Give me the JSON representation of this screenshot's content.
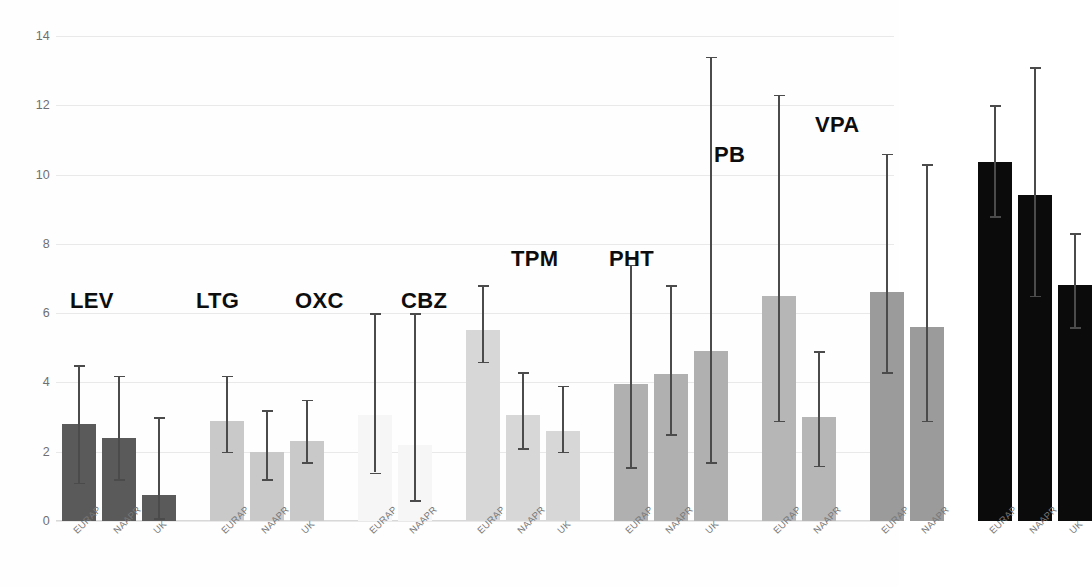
{
  "chart_data": {
    "type": "bar",
    "title": "",
    "xlabel": "",
    "ylabel": "",
    "ylim": [
      0,
      14
    ],
    "yticks": [
      0,
      2,
      4,
      6,
      8,
      10,
      12,
      14
    ],
    "ytick_labels": [
      "0",
      "2",
      "4",
      "6",
      "8",
      "10",
      "12",
      "14"
    ],
    "grid": true,
    "legend": "none",
    "error_bars": "95% confidence interval",
    "categories": [
      "EURAP",
      "NAAPR",
      "UK"
    ],
    "groups": [
      {
        "label": "LEV",
        "color": "#5a5a5a",
        "label_x": 70,
        "label_y": 288,
        "bars": [
          {
            "category": "EURAP",
            "value": 2.8,
            "ci_low": 1.1,
            "ci_high": 4.5
          },
          {
            "category": "NAAPR",
            "value": 2.4,
            "ci_low": 1.2,
            "ci_high": 4.2
          },
          {
            "category": "UK",
            "value": 0.75,
            "ci_low": 0.08,
            "ci_high": 3.0
          }
        ]
      },
      {
        "label": "LTG",
        "color": "#c9c9c9",
        "label_x": 196,
        "label_y": 288,
        "bars": [
          {
            "category": "EURAP",
            "value": 2.9,
            "ci_low": 2.0,
            "ci_high": 4.2
          },
          {
            "category": "NAAPR",
            "value": 2.0,
            "ci_low": 1.2,
            "ci_high": 3.2
          },
          {
            "category": "UK",
            "value": 2.3,
            "ci_low": 1.7,
            "ci_high": 3.5
          }
        ]
      },
      {
        "label": "OXC",
        "color": "#f6f6f6",
        "label_x": 295,
        "label_y": 288,
        "bars": [
          {
            "category": "EURAP",
            "value": 3.05,
            "ci_low": 1.4,
            "ci_high": 6.0
          },
          {
            "category": "NAAPR",
            "value": 2.2,
            "ci_low": 0.6,
            "ci_high": 6.0
          }
        ]
      },
      {
        "label": "CBZ",
        "color": "#d7d7d7",
        "label_x": 401,
        "label_y": 288,
        "bars": [
          {
            "category": "EURAP",
            "value": 5.5,
            "ci_low": 4.6,
            "ci_high": 6.8
          },
          {
            "category": "NAAPR",
            "value": 3.05,
            "ci_low": 2.1,
            "ci_high": 4.3
          },
          {
            "category": "UK",
            "value": 2.6,
            "ci_low": 2.0,
            "ci_high": 3.9
          }
        ]
      },
      {
        "label": "TPM",
        "color": "#b0b0b0",
        "label_x": 511,
        "label_y": 246,
        "bars": [
          {
            "category": "EURAP",
            "value": 3.95,
            "ci_low": 1.55,
            "ci_high": 7.4
          },
          {
            "category": "NAAPR",
            "value": 4.25,
            "ci_low": 2.5,
            "ci_high": 6.8
          },
          {
            "category": "UK",
            "value": 4.9,
            "ci_low": 1.7,
            "ci_high": 13.4
          }
        ]
      },
      {
        "label": "PHT",
        "color": "#b6b6b6",
        "label_x": 609,
        "label_y": 246,
        "bars": [
          {
            "category": "EURAP",
            "value": 6.5,
            "ci_low": 2.9,
            "ci_high": 12.3
          },
          {
            "category": "NAAPR",
            "value": 3.0,
            "ci_low": 1.6,
            "ci_high": 4.9
          }
        ]
      },
      {
        "label": "PB",
        "color": "#9b9b9b",
        "label_x": 714,
        "label_y": 142,
        "bars": [
          {
            "category": "EURAP",
            "value": 6.6,
            "ci_low": 4.3,
            "ci_high": 10.6
          },
          {
            "category": "NAAPR",
            "value": 5.6,
            "ci_low": 2.9,
            "ci_high": 10.3
          }
        ]
      },
      {
        "label": "VPA",
        "color": "#0b0b0b",
        "label_x": 815,
        "label_y": 112,
        "bars": [
          {
            "category": "EURAP",
            "value": 10.35,
            "ci_low": 8.8,
            "ci_high": 12.0
          },
          {
            "category": "NAAPR",
            "value": 9.4,
            "ci_low": 6.5,
            "ci_high": 13.1
          },
          {
            "category": "UK",
            "value": 6.8,
            "ci_low": 5.6,
            "ci_high": 8.3
          }
        ]
      }
    ]
  },
  "style": {
    "gridline_color": "#e9e9e9",
    "axis_text_color": "#6f6f6f",
    "error_bar_color": "#4b4b4b",
    "group_label_color": "#0d0d0d",
    "background": "#ffffff"
  }
}
